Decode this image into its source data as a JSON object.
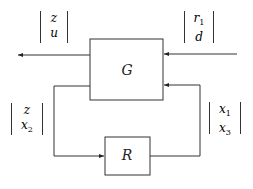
{
  "blocks": {
    "plant": "G",
    "controller": "R"
  },
  "vectors": {
    "top_left": [
      "z",
      "u"
    ],
    "top_right": [
      "r",
      "d"
    ],
    "top_right_sub": [
      "1",
      ""
    ],
    "mid_left": [
      "z",
      "x"
    ],
    "mid_left_sub": [
      "",
      "2"
    ],
    "mid_right": [
      "x",
      "x"
    ],
    "mid_right_sub": [
      "1",
      "3"
    ]
  }
}
